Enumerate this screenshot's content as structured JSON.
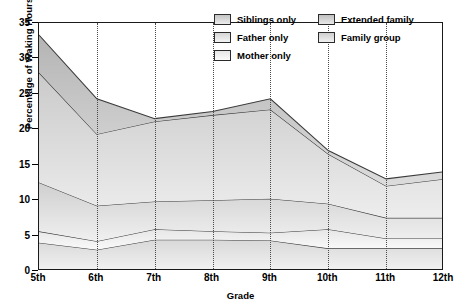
{
  "chart_data": {
    "type": "area",
    "title": "",
    "xlabel": "Grade",
    "ylabel": "Percentage of Waking Hours",
    "categories": [
      "5th",
      "6th",
      "7th",
      "8th",
      "9th",
      "10th",
      "11th",
      "12th"
    ],
    "ylim": [
      0,
      35
    ],
    "yticks": [
      0,
      5,
      10,
      15,
      20,
      25,
      30,
      35
    ],
    "grid": "vertical-dotted",
    "stacked": true,
    "legend_position": "top-right-inside",
    "series": [
      {
        "name": "Family group",
        "color": "#c9c9c9",
        "values": [
          4.0,
          3.0,
          4.4,
          4.4,
          4.3,
          3.2,
          3.2,
          3.2
        ]
      },
      {
        "name": "Mother only",
        "color": "#d9d9d9",
        "values": [
          1.6,
          1.2,
          1.5,
          1.2,
          1.1,
          2.7,
          1.4,
          1.4
        ]
      },
      {
        "name": "Father only",
        "color": "#d2d2d2",
        "values": [
          6.9,
          5.0,
          3.9,
          4.4,
          4.8,
          3.6,
          2.9,
          2.9
        ]
      },
      {
        "name": "Siblings only",
        "color": "#bdbdbd",
        "values": [
          15.5,
          10.1,
          11.3,
          12.0,
          12.6,
          7.0,
          4.5,
          5.5
        ]
      },
      {
        "name": "Extended family",
        "color": "#a8a8a8",
        "values": [
          5.3,
          5.0,
          0.4,
          0.5,
          1.5,
          0.5,
          1.0,
          1.0
        ]
      }
    ],
    "totals": [
      33.3,
      24.3,
      21.5,
      22.5,
      24.3,
      17.0,
      13.0,
      14.0
    ],
    "legend": [
      {
        "label": "Siblings only",
        "swatch": "#bdbdbd"
      },
      {
        "label": "Father only",
        "swatch": "#d2d2d2"
      },
      {
        "label": "Mother only",
        "swatch": "#e2e2e2"
      },
      {
        "label": "Extended family",
        "swatch": "#b5b5b5"
      },
      {
        "label": "Family group",
        "swatch": "#c9c9c9"
      }
    ]
  },
  "axes": {
    "y_ticks": [
      "0",
      "5",
      "10",
      "15",
      "20",
      "25",
      "30",
      "35"
    ],
    "x_ticks": [
      "5th",
      "6th",
      "7th",
      "8th",
      "9th",
      "10th",
      "11th",
      "12th"
    ],
    "y_title": "Percentage of Waking Hours",
    "x_title": "Grade"
  }
}
